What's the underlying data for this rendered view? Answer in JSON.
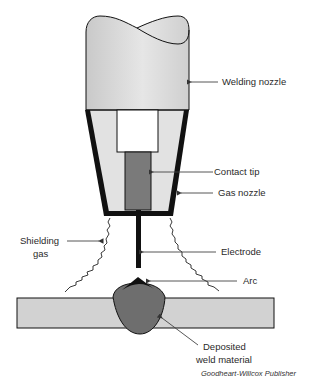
{
  "diagram": {
    "labels": {
      "welding_nozzle": "Welding nozzle",
      "contact_tip": "Contact tip",
      "gas_nozzle": "Gas nozzle",
      "shielding_gas_line1": "Shielding",
      "shielding_gas_line2": "gas",
      "electrode": "Electrode",
      "arc": "Arc",
      "deposited_line1": "Deposited",
      "deposited_line2": "weld material"
    },
    "credit": "Goodheart-Willcox Publisher",
    "colors": {
      "nozzle_fill": "#d6d6d6",
      "inner_fill": "#e4e4e4",
      "contact_tip_fill": "#7a7a7a",
      "weld_fill": "#6e6e6e",
      "workpiece_fill": "#d2d2d2",
      "outline": "#111111",
      "arc_fill": "#111111",
      "leader_line": "#555555"
    }
  }
}
